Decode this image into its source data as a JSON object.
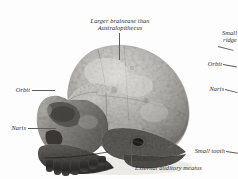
{
  "figure": {
    "background_color": "#ffffff",
    "label_color": "#2b2b2b",
    "leader_color": "#5d5d5d"
  },
  "labels": {
    "braincase": "Larger braincase than\nAustralopithecus",
    "small_ridge": "Small\nridge",
    "orbit_right": "Orbit",
    "naris_right": "Naris",
    "small_tooth": "Small tooth",
    "orbit_left": "Orbit",
    "naris_left": "Naris",
    "external_auditory_meatus": "External auditory meatus"
  },
  "specimen": {
    "tone_light": "#d8d6d2",
    "tone_mid": "#a9a7a2",
    "tone_dark": "#6e6c68",
    "tone_darkest": "#3c3a37"
  }
}
